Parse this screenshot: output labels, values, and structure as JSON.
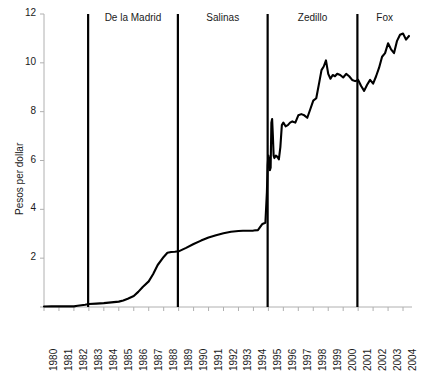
{
  "chart_data": {
    "type": "line",
    "title": "",
    "xlabel": "",
    "ylabel": "Pesos per dollar",
    "xlim": [
      1980,
      2004.6
    ],
    "ylim": [
      0,
      12
    ],
    "yticks": [
      0,
      2,
      4,
      6,
      8,
      10,
      12
    ],
    "ytick_labels": [
      "",
      "2",
      "4",
      "6",
      "8",
      "10",
      "12"
    ],
    "xticks": [
      1980,
      1981,
      1982,
      1983,
      1984,
      1985,
      1986,
      1987,
      1988,
      1989,
      1990,
      1991,
      1992,
      1993,
      1994,
      1995,
      1996,
      1997,
      1998,
      1999,
      2000,
      2001,
      2002,
      2003,
      2004
    ],
    "xtick_labels": [
      "1980",
      "1981",
      "1982",
      "1983",
      "1984",
      "1985",
      "1986",
      "1987",
      "1988",
      "1989",
      "1990",
      "1991",
      "1992",
      "1993",
      "1994",
      "1995",
      "1996",
      "1997",
      "1998",
      "1999",
      "2000",
      "2001",
      "2002",
      "2003",
      "2004"
    ],
    "grid": false,
    "legend": "none",
    "series": [
      {
        "name": "Pesos per dollar",
        "color": "#000000",
        "x": [
          1980.0,
          1980.5,
          1981.0,
          1981.5,
          1982.0,
          1982.25,
          1982.5,
          1982.75,
          1983.0,
          1983.5,
          1984.0,
          1984.5,
          1985.0,
          1985.3,
          1985.6,
          1986.0,
          1986.3,
          1986.6,
          1987.0,
          1987.3,
          1987.6,
          1988.0,
          1988.25,
          1988.5,
          1988.75,
          1989.0,
          1989.5,
          1990.0,
          1990.5,
          1991.0,
          1991.5,
          1992.0,
          1992.5,
          1993.0,
          1993.3,
          1993.6,
          1994.0,
          1994.3,
          1994.6,
          1994.8,
          1994.9,
          1994.95,
          1995.0,
          1995.05,
          1995.1,
          1995.15,
          1995.2,
          1995.25,
          1995.3,
          1995.35,
          1995.4,
          1995.5,
          1995.6,
          1995.7,
          1995.8,
          1995.9,
          1996.0,
          1996.15,
          1996.3,
          1996.45,
          1996.6,
          1996.8,
          1997.0,
          1997.2,
          1997.4,
          1997.6,
          1997.8,
          1998.0,
          1998.2,
          1998.4,
          1998.55,
          1998.7,
          1998.85,
          1999.0,
          1999.15,
          1999.3,
          1999.45,
          1999.6,
          1999.8,
          2000.0,
          2000.2,
          2000.4,
          2000.6,
          2000.8,
          2001.0,
          2001.2,
          2001.4,
          2001.6,
          2001.8,
          2002.0,
          2002.2,
          2002.4,
          2002.6,
          2002.8,
          2003.0,
          2003.2,
          2003.4,
          2003.6,
          2003.8,
          2004.0,
          2004.2,
          2004.4
        ],
        "y": [
          0.023,
          0.024,
          0.025,
          0.026,
          0.027,
          0.05,
          0.075,
          0.095,
          0.12,
          0.14,
          0.16,
          0.19,
          0.22,
          0.27,
          0.34,
          0.45,
          0.62,
          0.82,
          1.05,
          1.35,
          1.72,
          2.05,
          2.22,
          2.25,
          2.26,
          2.28,
          2.42,
          2.58,
          2.72,
          2.85,
          2.94,
          3.02,
          3.08,
          3.11,
          3.12,
          3.12,
          3.13,
          3.15,
          3.4,
          3.45,
          4.7,
          5.8,
          6.2,
          6.0,
          5.6,
          5.7,
          7.55,
          7.7,
          7.0,
          6.2,
          6.1,
          6.2,
          6.15,
          6.05,
          6.55,
          7.45,
          7.55,
          7.4,
          7.45,
          7.55,
          7.6,
          7.55,
          7.85,
          7.9,
          7.85,
          7.75,
          8.1,
          8.45,
          8.55,
          9.2,
          9.7,
          9.85,
          10.1,
          9.55,
          9.35,
          9.5,
          9.45,
          9.55,
          9.5,
          9.4,
          9.55,
          9.45,
          9.3,
          9.25,
          9.3,
          9.05,
          8.85,
          9.1,
          9.3,
          9.15,
          9.45,
          9.8,
          10.25,
          10.4,
          10.8,
          10.55,
          10.4,
          10.9,
          11.15,
          11.2,
          10.95,
          11.1
        ]
      }
    ],
    "vertical_markers": [
      {
        "label": "De la Madrid",
        "start": 1982.95,
        "end": 1988.95
      },
      {
        "label": "Salinas",
        "start": 1988.95,
        "end": 1994.95
      },
      {
        "label": "Zedillo",
        "start": 1994.95,
        "end": 2000.95
      },
      {
        "label": "Fox",
        "start": 2000.95,
        "end": 2004.6
      }
    ]
  },
  "colors": {
    "line": "#000000",
    "axis": "#b0b0b0",
    "marker": "#000000",
    "text": "#1a1a1a"
  }
}
